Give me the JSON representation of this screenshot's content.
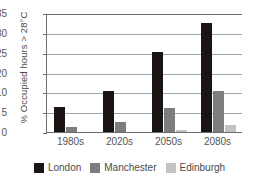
{
  "chart_data": {
    "type": "bar",
    "title": "",
    "subtitle": "",
    "xlabel": "",
    "ylabel": "% Occupied hours > 28°C",
    "categories": [
      "1980s",
      "2020s",
      "2050s",
      "2080s"
    ],
    "series": [
      {
        "name": "London",
        "color": "#1a1512",
        "values": [
          7.5,
          12.0,
          23.5,
          32.0
        ]
      },
      {
        "name": "Manchester",
        "color": "#7d7d7d",
        "values": [
          1.5,
          3.0,
          7.0,
          12.0
        ]
      },
      {
        "name": "Edinburgh",
        "color": "#c3c3c3",
        "values": [
          0.0,
          0.0,
          0.5,
          2.2
        ]
      }
    ],
    "ylim": [
      0,
      35
    ],
    "yticks": [
      0,
      5,
      10,
      20,
      25,
      30,
      35
    ],
    "ytick_labels": [
      "0",
      "5",
      "10",
      "20",
      "25",
      "30",
      "35"
    ],
    "grid": true,
    "grid_axis": "y",
    "legend_position": "bottom"
  },
  "legend": {
    "items": [
      {
        "label": "London"
      },
      {
        "label": "Manchester"
      },
      {
        "label": "Edinburgh"
      }
    ]
  }
}
